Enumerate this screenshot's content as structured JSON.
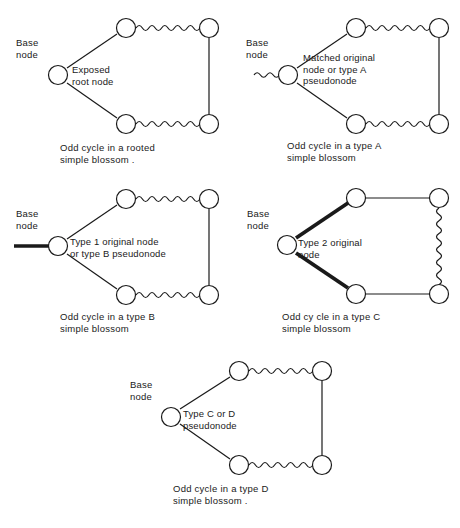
{
  "document": {
    "type": "technical-figure-sheet",
    "subject": "Odd cycles in simple blossoms",
    "background_color": "#ffffff",
    "ink_color": "#1a1a1a",
    "figure_count": 5
  },
  "legend": {
    "edge_styles": {
      "thin_straight": "ordinary (unmatched) edge",
      "wavy": "alternating / matched path edge",
      "thick_straight": "matched edge"
    },
    "node_glyph": "open circle"
  },
  "figures": [
    {
      "id": "figure-rooted",
      "base_label": "Base\nnode",
      "node_label": "Exposed\nroot node",
      "caption": "Odd cycle in a rooted\nsimple blossom .",
      "stem": "none",
      "left_edges": "thin",
      "top_edge": "wavy",
      "bottom_edge": "wavy",
      "right_edge": "thin"
    },
    {
      "id": "figure-type-a",
      "base_label": "Base\nnode",
      "node_label": "Matched original\nnode or type A\npseudonode",
      "caption": "Odd cycle in a type A\nsimple blossom",
      "stem": "wavy",
      "left_edges": "thin",
      "top_edge": "wavy",
      "bottom_edge": "wavy",
      "right_edge": "thin"
    },
    {
      "id": "figure-type-b",
      "base_label": "Base\nnode",
      "node_label": "Type 1 original node\nor type B pseudonode",
      "caption": "Odd cycle in a type B\nsimple blossom",
      "stem": "thick",
      "left_edges": "thin",
      "top_edge": "wavy",
      "bottom_edge": "wavy",
      "right_edge": "thin"
    },
    {
      "id": "figure-type-c",
      "base_label": "Base\nnode",
      "node_label": "Type 2 original\nnode",
      "caption": "Odd cy cle in a type C\nsimple blossom",
      "stem": "none",
      "left_edges": "thick",
      "top_edge": "thin",
      "bottom_edge": "thin",
      "right_edge": "wavy"
    },
    {
      "id": "figure-type-d",
      "base_label": "Base\nnode",
      "node_label": "Type C or D\npseudonode",
      "caption": "Odd cycle in a type D\nsimple blossom .",
      "stem": "none",
      "left_edges": "thin",
      "top_edge": "wavy",
      "bottom_edge": "wavy",
      "right_edge": "thin"
    }
  ]
}
